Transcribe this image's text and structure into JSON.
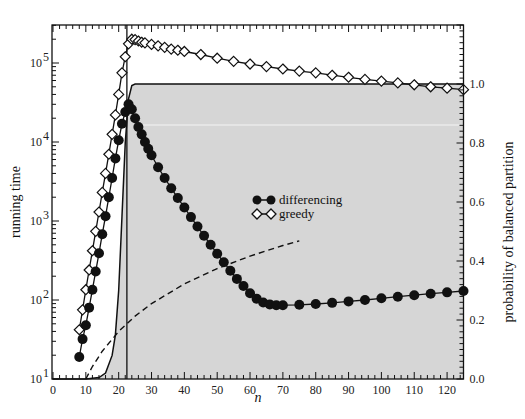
{
  "chart_data": {
    "type": "line",
    "title": "",
    "xlabel": "n",
    "ylabel": "running time",
    "y2label": "probability of balanced partition",
    "xlim": [
      0,
      125
    ],
    "ylim": [
      10,
      300000
    ],
    "yscale": "log",
    "y2lim": [
      0.0,
      1.2
    ],
    "grid": false,
    "legend_position": "center",
    "x_ticks": [
      0,
      10,
      20,
      30,
      40,
      50,
      60,
      70,
      80,
      90,
      100,
      110,
      120
    ],
    "y_ticks": [
      {
        "value": 10,
        "base": "10",
        "exp": "1"
      },
      {
        "value": 100,
        "base": "10",
        "exp": "2"
      },
      {
        "value": 1000,
        "base": "10",
        "exp": "3"
      },
      {
        "value": 10000,
        "base": "10",
        "exp": "4"
      },
      {
        "value": 100000,
        "base": "10",
        "exp": "5"
      }
    ],
    "y2_ticks": [
      "0.0",
      "0.2",
      "0.4",
      "0.6",
      "0.8",
      "1.0"
    ],
    "transition_line_x": 22.5,
    "series": [
      {
        "name": "differencing",
        "marker": "filled-circle",
        "axis": "left",
        "x": [
          8,
          9,
          10,
          11,
          12,
          13,
          14,
          15,
          16,
          17,
          18,
          19,
          20,
          21,
          22,
          23,
          24,
          25,
          26,
          27,
          28,
          29,
          30,
          32,
          34,
          36,
          38,
          40,
          42,
          44,
          46,
          48,
          50,
          52,
          54,
          56,
          58,
          60,
          62,
          64,
          66,
          68,
          70,
          75,
          80,
          85,
          90,
          95,
          100,
          105,
          110,
          115,
          120,
          125
        ],
        "values": [
          19,
          32,
          48,
          80,
          135,
          230,
          390,
          680,
          1150,
          2000,
          3500,
          6200,
          10500,
          17000,
          24000,
          30000,
          26000,
          20000,
          15500,
          12500,
          10000,
          8200,
          6800,
          4800,
          3500,
          2600,
          1950,
          1480,
          1120,
          850,
          650,
          500,
          385,
          300,
          235,
          185,
          150,
          122,
          104,
          93,
          88,
          86,
          86,
          87,
          89,
          92,
          96,
          100,
          105,
          110,
          115,
          120,
          125,
          130
        ]
      },
      {
        "name": "greedy",
        "marker": "open-diamond",
        "axis": "left",
        "x": [
          8,
          9,
          10,
          11,
          12,
          13,
          14,
          15,
          16,
          17,
          18,
          19,
          20,
          21,
          22,
          23,
          24,
          25,
          26,
          27,
          28,
          30,
          32,
          34,
          36,
          38,
          40,
          45,
          50,
          55,
          60,
          65,
          70,
          75,
          80,
          85,
          90,
          95,
          100,
          105,
          110,
          115,
          120,
          125
        ],
        "values": [
          42,
          75,
          135,
          240,
          420,
          740,
          1300,
          2300,
          4000,
          7000,
          12500,
          22000,
          40000,
          75000,
          120000,
          175000,
          200000,
          198000,
          190000,
          183000,
          180000,
          172000,
          165000,
          158000,
          150000,
          145000,
          140000,
          128000,
          115000,
          105000,
          97000,
          90000,
          84000,
          79000,
          75000,
          70000,
          66000,
          62000,
          59000,
          56000,
          53000,
          50000,
          48000,
          46000
        ]
      },
      {
        "name": "probability of balanced partition",
        "style": "solid-line-filled",
        "axis": "right",
        "x": [
          0,
          10,
          14,
          16,
          18,
          19,
          20,
          21,
          22,
          23,
          24,
          25,
          26,
          125
        ],
        "values": [
          0.0,
          0.0,
          0.005,
          0.02,
          0.08,
          0.15,
          0.3,
          0.55,
          0.8,
          0.95,
          0.995,
          1.0,
          1.0,
          1.0
        ]
      },
      {
        "name": "n^2 reference",
        "style": "dashed",
        "axis": "left",
        "x": [
          10,
          12,
          15,
          20,
          25,
          30,
          40,
          50,
          60,
          70,
          75
        ],
        "values": [
          10,
          14.4,
          22.5,
          40,
          62.5,
          90,
          160,
          250,
          360,
          490,
          562
        ]
      }
    ]
  },
  "legend": {
    "items": [
      {
        "label": "differencing"
      },
      {
        "label": "greedy"
      }
    ]
  },
  "axes": {
    "xlabel": "n",
    "ylabel": "running time",
    "y2label": "probability of balanced partition"
  }
}
